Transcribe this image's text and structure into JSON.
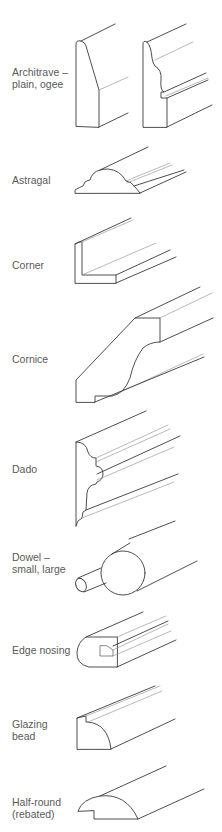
{
  "figure": {
    "type": "moulding-profiles-reference",
    "items": [
      {
        "id": "architrave",
        "label": "Architrave –\nplain, ogee"
      },
      {
        "id": "astragal",
        "label": "Astragal"
      },
      {
        "id": "corner",
        "label": "Corner"
      },
      {
        "id": "cornice",
        "label": "Cornice"
      },
      {
        "id": "dado",
        "label": "Dado"
      },
      {
        "id": "dowel",
        "label": "Dowel –\nsmall, large"
      },
      {
        "id": "edge-nosing",
        "label": "Edge nosing"
      },
      {
        "id": "glazing-bead",
        "label": "Glazing\nbead"
      },
      {
        "id": "half-round",
        "label": "Half-round\n(rebated)"
      }
    ]
  }
}
